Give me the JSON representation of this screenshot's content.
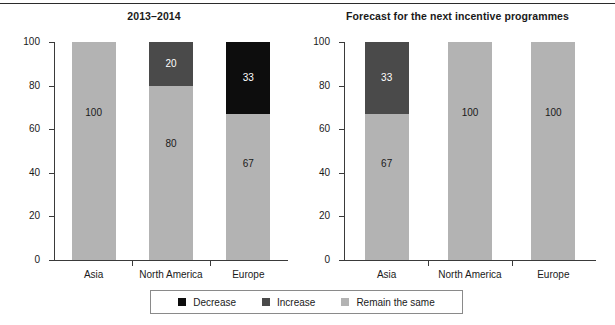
{
  "chart_data": [
    {
      "type": "bar",
      "title": "2013–2014",
      "stacked": true,
      "categories": [
        "Asia",
        "North America",
        "Europe"
      ],
      "series": [
        {
          "name": "Decrease",
          "color": "#0d0d0d",
          "values": [
            0,
            0,
            33
          ]
        },
        {
          "name": "Increase",
          "color": "#4a4a4a",
          "values": [
            0,
            20,
            0
          ]
        },
        {
          "name": "Remain the same",
          "color": "#b3b3b3",
          "values": [
            100,
            80,
            67
          ]
        }
      ],
      "xlabel": "",
      "ylabel": "",
      "ylim": [
        0,
        100
      ],
      "yticks": [
        0,
        20,
        40,
        60,
        80,
        100
      ],
      "grid": false
    },
    {
      "type": "bar",
      "title": "Forecast for the next incentive programmes",
      "stacked": true,
      "categories": [
        "Asia",
        "North America",
        "Europe"
      ],
      "series": [
        {
          "name": "Decrease",
          "color": "#0d0d0d",
          "values": [
            0,
            0,
            0
          ]
        },
        {
          "name": "Increase",
          "color": "#4a4a4a",
          "values": [
            33,
            0,
            0
          ]
        },
        {
          "name": "Remain the same",
          "color": "#b3b3b3",
          "values": [
            67,
            100,
            100
          ]
        }
      ],
      "xlabel": "",
      "ylabel": "",
      "ylim": [
        0,
        100
      ],
      "yticks": [
        0,
        20,
        40,
        60,
        80,
        100
      ],
      "grid": false
    }
  ],
  "charts": {
    "left": {
      "title": "2013–2014",
      "yticks": [
        "100",
        "80",
        "60",
        "40",
        "20",
        "0"
      ],
      "categories": [
        "Asia",
        "North America",
        "Europe"
      ],
      "bars": [
        {
          "category": "Asia",
          "segments": [
            {
              "series": "Remain the same",
              "value": "100",
              "from": 0,
              "to": 100,
              "color": "#b3b3b3",
              "text": "#1a1a1a"
            }
          ]
        },
        {
          "category": "North America",
          "segments": [
            {
              "series": "Increase",
              "value": "20",
              "from": 80,
              "to": 100,
              "color": "#4a4a4a",
              "text": "#ffffff"
            },
            {
              "series": "Remain the same",
              "value": "80",
              "from": 0,
              "to": 80,
              "color": "#b3b3b3",
              "text": "#1a1a1a"
            }
          ]
        },
        {
          "category": "Europe",
          "segments": [
            {
              "series": "Decrease",
              "value": "33",
              "from": 67,
              "to": 100,
              "color": "#0d0d0d",
              "text": "#ffffff"
            },
            {
              "series": "Remain the same",
              "value": "67",
              "from": 0,
              "to": 67,
              "color": "#b3b3b3",
              "text": "#1a1a1a"
            }
          ]
        }
      ]
    },
    "right": {
      "title": "Forecast for the next incentive programmes",
      "yticks": [
        "100",
        "80",
        "60",
        "40",
        "20",
        "0"
      ],
      "categories": [
        "Asia",
        "North America",
        "Europe"
      ],
      "bars": [
        {
          "category": "Asia",
          "segments": [
            {
              "series": "Increase",
              "value": "33",
              "from": 67,
              "to": 100,
              "color": "#4a4a4a",
              "text": "#ffffff"
            },
            {
              "series": "Remain the same",
              "value": "67",
              "from": 0,
              "to": 67,
              "color": "#b3b3b3",
              "text": "#1a1a1a"
            }
          ]
        },
        {
          "category": "North America",
          "segments": [
            {
              "series": "Remain the same",
              "value": "100",
              "from": 0,
              "to": 100,
              "color": "#b3b3b3",
              "text": "#1a1a1a"
            }
          ]
        },
        {
          "category": "Europe",
          "segments": [
            {
              "series": "Remain the same",
              "value": "100",
              "from": 0,
              "to": 100,
              "color": "#b3b3b3",
              "text": "#1a1a1a"
            }
          ]
        }
      ]
    }
  },
  "legend": {
    "items": [
      {
        "label": "Decrease",
        "color": "#0d0d0d"
      },
      {
        "label": "Increase",
        "color": "#4a4a4a"
      },
      {
        "label": "Remain the same",
        "color": "#b3b3b3"
      }
    ]
  }
}
